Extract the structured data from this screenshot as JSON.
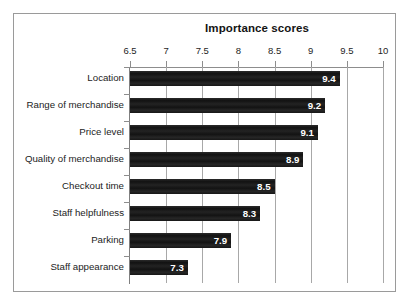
{
  "chart_data": {
    "type": "bar",
    "orientation": "horizontal",
    "title": "Importance scores",
    "xlabel": "",
    "ylabel": "",
    "xlim": [
      6.5,
      10
    ],
    "ylim": null,
    "grid": true,
    "legend": false,
    "legend_position": "none",
    "axis_position": "top",
    "categories": [
      "Location",
      "Range of merchandise",
      "Price level",
      "Quality of merchandise",
      "Checkout time",
      "Staff helpfulness",
      "Parking",
      "Staff appearance"
    ],
    "values": [
      9.4,
      9.2,
      9.1,
      8.9,
      8.5,
      8.3,
      7.9,
      7.3
    ],
    "data_labels": [
      "9.4",
      "9.2",
      "9.1",
      "8.9",
      "8.5",
      "8.3",
      "7.9",
      "7.3"
    ],
    "xticks": [
      6.5,
      7,
      7.5,
      8,
      8.5,
      9,
      9.5,
      10
    ],
    "xtick_labels": [
      "6.5",
      "7",
      "7.5",
      "8",
      "8.5",
      "9",
      "9.5",
      "10"
    ],
    "bar_color": "#1c1c1c",
    "data_label_color": "#ffffff",
    "grid_color": "#a8a8a8",
    "axis_color": "#8d8d8d",
    "frame_color": "#9a9a9a",
    "background_color": "#ffffff"
  }
}
